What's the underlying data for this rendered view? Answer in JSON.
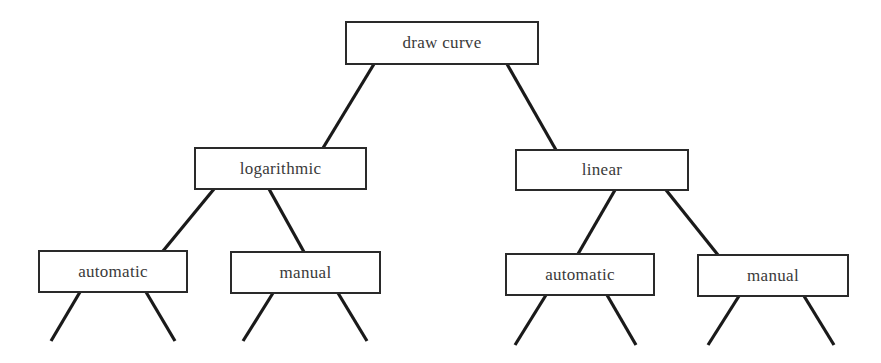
{
  "diagram": {
    "type": "tree",
    "root": {
      "id": "draw_curve",
      "label": "draw curve",
      "children": [
        "logarithmic",
        "linear"
      ]
    },
    "nodes": {
      "draw_curve": {
        "label": "draw curve"
      },
      "logarithmic": {
        "label": "logarithmic"
      },
      "linear": {
        "label": "linear"
      },
      "log_automatic": {
        "label": "automatic"
      },
      "log_manual": {
        "label": "manual"
      },
      "lin_automatic": {
        "label": "automatic"
      },
      "lin_manual": {
        "label": "manual"
      }
    },
    "edges": [
      {
        "from": "draw_curve",
        "to": "logarithmic"
      },
      {
        "from": "draw_curve",
        "to": "linear"
      },
      {
        "from": "logarithmic",
        "to": "log_automatic"
      },
      {
        "from": "logarithmic",
        "to": "log_manual"
      },
      {
        "from": "linear",
        "to": "lin_automatic"
      },
      {
        "from": "linear",
        "to": "lin_manual"
      }
    ],
    "open_branches_note": "each leaf node has two continuing lines extending downward off-diagram",
    "colors": {
      "line": "#1a1a1a",
      "box_border": "#2a2a2a",
      "text": "#3a3a3a",
      "background": "#ffffff"
    }
  }
}
